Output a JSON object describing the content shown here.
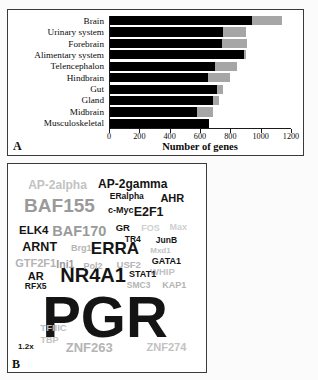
{
  "figure": {
    "panel_a_label": "A",
    "panel_b_label": "B"
  },
  "chart_data": {
    "type": "bar",
    "orientation": "horizontal",
    "stacked": true,
    "title": "",
    "xlabel": "Number of genes",
    "ylabel": "",
    "xlim": [
      0,
      1200
    ],
    "xticks": [
      0,
      200,
      400,
      600,
      800,
      1000,
      1200
    ],
    "grid": false,
    "legend": "none",
    "categories": [
      "Brain",
      "Urinary system",
      "Forebrain",
      "Alimentary system",
      "Telencephalon",
      "Hindbrain",
      "Gut",
      "Gland",
      "Midbrain",
      "Musculoskeletal"
    ],
    "series": [
      {
        "name": "black",
        "color": "#000000",
        "values": [
          935,
          745,
          740,
          885,
          690,
          645,
          705,
          680,
          575,
          655
        ]
      },
      {
        "name": "gray",
        "color": "#a6a6a6",
        "values": [
          200,
          155,
          165,
          10,
          150,
          145,
          40,
          40,
          105,
          0
        ]
      }
    ],
    "totals": [
      1135,
      900,
      905,
      895,
      840,
      790,
      745,
      720,
      680,
      655
    ]
  },
  "word_cloud": {
    "scale_note": "1.2x",
    "words": [
      {
        "text": "PGR",
        "x": 49,
        "y": 73.5,
        "size": 58,
        "color": "#141414"
      },
      {
        "text": "NR4A1",
        "x": 43,
        "y": 53.5,
        "size": 20,
        "color": "#141414"
      },
      {
        "text": "BAF155",
        "x": 26,
        "y": 19.5,
        "size": 19,
        "color": "#9a9a9a"
      },
      {
        "text": "ERRA",
        "x": 54,
        "y": 40.5,
        "size": 17,
        "color": "#141414"
      },
      {
        "text": "BAF170",
        "x": 36,
        "y": 32,
        "size": 14.5,
        "color": "#9a9a9a"
      },
      {
        "text": "ZNF263",
        "x": 41,
        "y": 88,
        "size": 13,
        "color": "#b4b4b4"
      },
      {
        "text": "AP-2alpha",
        "x": 25,
        "y": 10,
        "size": 12,
        "color": "#c2c2c2"
      },
      {
        "text": "AP-2gamma",
        "x": 63,
        "y": 9.5,
        "size": 12,
        "color": "#141414"
      },
      {
        "text": "ARNT",
        "x": 16,
        "y": 40,
        "size": 12.5,
        "color": "#141414"
      },
      {
        "text": "E2F1",
        "x": 71,
        "y": 23,
        "size": 12.5,
        "color": "#141414"
      },
      {
        "text": "ELK4",
        "x": 13,
        "y": 32,
        "size": 11.5,
        "color": "#141414"
      },
      {
        "text": "AHR",
        "x": 83,
        "y": 16.5,
        "size": 11,
        "color": "#141414"
      },
      {
        "text": "ZNF274",
        "x": 80,
        "y": 88,
        "size": 11,
        "color": "#c2c2c2"
      },
      {
        "text": "GTF2F1",
        "x": 14,
        "y": 47.5,
        "size": 11,
        "color": "#b4b4b4"
      },
      {
        "text": "AR",
        "x": 14,
        "y": 54,
        "size": 11,
        "color": "#141414"
      },
      {
        "text": "Ini1",
        "x": 29,
        "y": 48,
        "size": 10.5,
        "color": "#9a9a9a"
      },
      {
        "text": "TFIIIC",
        "x": 23,
        "y": 79,
        "size": 9.5,
        "color": "#bcbcbc"
      },
      {
        "text": "TBP",
        "x": 21,
        "y": 84.5,
        "size": 9,
        "color": "#c2c2c2"
      },
      {
        "text": "USF2",
        "x": 61,
        "y": 48.5,
        "size": 9.5,
        "color": "#b4b4b4"
      },
      {
        "text": "Pol2",
        "x": 43,
        "y": 49,
        "size": 9,
        "color": "#b4b4b4"
      },
      {
        "text": "WHIP",
        "x": 78,
        "y": 52,
        "size": 9.5,
        "color": "#c2c2c2"
      },
      {
        "text": "ERalpha",
        "x": 60,
        "y": 15.5,
        "size": 8.5,
        "color": "#141414"
      },
      {
        "text": "c-Myc",
        "x": 57,
        "y": 22,
        "size": 9,
        "color": "#141414"
      },
      {
        "text": "GR",
        "x": 58,
        "y": 31,
        "size": 9.5,
        "color": "#141414"
      },
      {
        "text": "FOS",
        "x": 72,
        "y": 31,
        "size": 9,
        "color": "#cfcfcf"
      },
      {
        "text": "Max",
        "x": 86,
        "y": 30.5,
        "size": 9,
        "color": "#cfcfcf"
      },
      {
        "text": "TR4",
        "x": 63,
        "y": 36,
        "size": 8.5,
        "color": "#141414"
      },
      {
        "text": "JunB",
        "x": 80,
        "y": 36.5,
        "size": 8.5,
        "color": "#141414"
      },
      {
        "text": "Brg1",
        "x": 37,
        "y": 40.5,
        "size": 9,
        "color": "#b4b4b4"
      },
      {
        "text": "Mxd1",
        "x": 77,
        "y": 42,
        "size": 8,
        "color": "#c2c2c2"
      },
      {
        "text": "GATA1",
        "x": 80,
        "y": 46.5,
        "size": 9,
        "color": "#141414"
      },
      {
        "text": "STAT1",
        "x": 68,
        "y": 53,
        "size": 9,
        "color": "#141414"
      },
      {
        "text": "SMC3",
        "x": 66,
        "y": 58,
        "size": 8.5,
        "color": "#b4b4b4"
      },
      {
        "text": "KAP1",
        "x": 84,
        "y": 58,
        "size": 9,
        "color": "#b4b4b4"
      },
      {
        "text": "RFX5",
        "x": 14,
        "y": 58.5,
        "size": 8.5,
        "color": "#141414"
      }
    ]
  }
}
